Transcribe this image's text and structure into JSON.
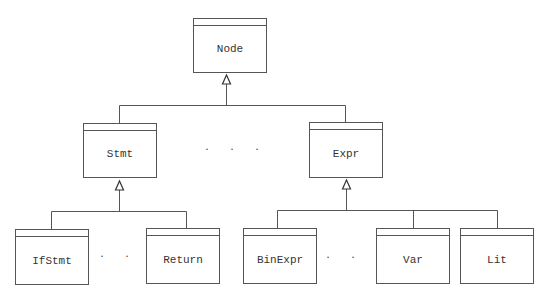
{
  "diagram": {
    "type": "uml-class-hierarchy",
    "relation": "generalization",
    "stroke_color": "#555555",
    "background": "#ffffff",
    "classes": {
      "node": {
        "label": "Node"
      },
      "stmt": {
        "label": "Stmt"
      },
      "expr": {
        "label": "Expr"
      },
      "ifstmt": {
        "label": "IfStmt"
      },
      "return": {
        "label": "Return"
      },
      "binexpr": {
        "label": "BinExpr"
      },
      "var": {
        "label": "Var"
      },
      "lit": {
        "label": "Lit"
      }
    },
    "edges": [
      {
        "from": "stmt",
        "to": "node"
      },
      {
        "from": "expr",
        "to": "node"
      },
      {
        "from": "ifstmt",
        "to": "stmt"
      },
      {
        "from": "return",
        "to": "stmt"
      },
      {
        "from": "binexpr",
        "to": "expr"
      },
      {
        "from": "var",
        "to": "expr"
      },
      {
        "from": "lit",
        "to": "expr"
      }
    ],
    "ellipses": {
      "level1": "· · ·",
      "stmt_children": "· · ·",
      "expr_children": "· · ·"
    }
  }
}
